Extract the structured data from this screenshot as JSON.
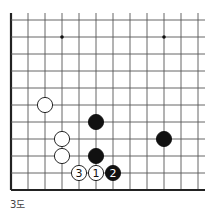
{
  "diagram": {
    "caption": "3도",
    "grid": {
      "origin_x": 11,
      "origin_y": 20,
      "spacing": 17,
      "cols": 12,
      "rows": 11,
      "left_edge": true,
      "bottom_edge": true,
      "line_color": "#555555",
      "edge_color": "#222222"
    },
    "star_points": [
      {
        "col": 3,
        "row": 1
      },
      {
        "col": 9,
        "row": 1
      }
    ],
    "stones": [
      {
        "color": "white",
        "col": 2,
        "row": 5,
        "label": ""
      },
      {
        "color": "black",
        "col": 5,
        "row": 6,
        "label": ""
      },
      {
        "color": "white",
        "col": 3,
        "row": 7,
        "label": ""
      },
      {
        "color": "black",
        "col": 9,
        "row": 7,
        "label": ""
      },
      {
        "color": "white",
        "col": 3,
        "row": 8,
        "label": ""
      },
      {
        "color": "black",
        "col": 5,
        "row": 8,
        "label": ""
      },
      {
        "color": "white",
        "col": 4,
        "row": 9,
        "label": "3"
      },
      {
        "color": "white",
        "col": 5,
        "row": 9,
        "label": "1"
      },
      {
        "color": "black",
        "col": 6,
        "row": 9,
        "label": "2"
      }
    ]
  }
}
